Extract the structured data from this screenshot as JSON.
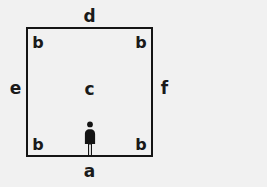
{
  "diagram": {
    "type": "geometric-room-diagram",
    "background_color": "#f1f1f1",
    "stroke_color": "#151515",
    "shape": "square",
    "labels": {
      "top_edge": "d",
      "bottom_edge": "a",
      "left_edge": "e",
      "right_edge": "f",
      "center": "c",
      "corner_top_left": "b",
      "corner_top_right": "b",
      "corner_bottom_left": "b",
      "corner_bottom_right": "b"
    },
    "figure": {
      "name": "person-pictogram",
      "position": "bottom-center-inside-square"
    }
  }
}
